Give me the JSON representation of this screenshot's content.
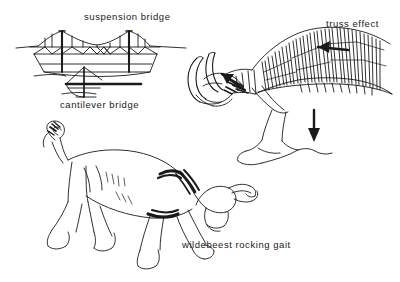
{
  "figure": {
    "background_color": "#ffffff",
    "ink_color": "#1a1a1a",
    "width": 400,
    "height": 282
  },
  "labels": {
    "suspension_bridge": "suspension bridge",
    "cantilever_bridge": "cantilever bridge",
    "truss_effect": "truss effect",
    "wildebeest_rocking_gait": "wildebeest rocking gait"
  },
  "panels": [
    {
      "name": "suspension-bridge-diagram",
      "label": "suspension bridge",
      "description": "Side elevation line drawing of a suspension bridge with two vertical towers, draped main cables, vertical hangers and an X-braced deck truss over a hull-shaped span."
    },
    {
      "name": "cantilever-bridge-diagram",
      "label": "cantilever bridge",
      "description": "Side elevation line drawing of a cantilever bridge: a single vertical pier with diagonal stays forming a triangle and a heavy horizontal deck beam extending to the right."
    },
    {
      "name": "wildebeest-skeleton-diagram",
      "label": "truss effect",
      "description": "Detailed skeletal drawing of a wildebeest head, neck and thorax showing curved horns, cervical vertebrae, and the long dorsal vertebral spines of the withers acting as a truss; arrows indicate load direction."
    },
    {
      "name": "wildebeest-body-diagram",
      "label": "wildebeest rocking gait",
      "description": "Full body line drawing of a wildebeest with head lowered, tail curled up, and legs extended in the characteristic rocking gait stride."
    }
  ],
  "annotations": [
    {
      "name": "truss-load-arrow-upper",
      "direction": "left",
      "meaning": "compression along dorsal spines"
    },
    {
      "name": "truss-load-arrow-shoulder",
      "direction": "up-left",
      "meaning": "force transferred to shoulder"
    },
    {
      "name": "truss-load-arrow-limb",
      "direction": "down",
      "meaning": "ground reaction force through forelimb"
    }
  ]
}
